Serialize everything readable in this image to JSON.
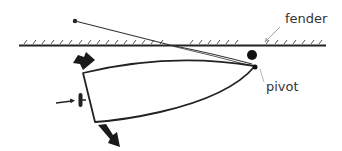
{
  "diagram": {
    "labels": {
      "fender": "fender",
      "pivot": "pivot"
    },
    "colors": {
      "stroke": "#222222",
      "fill": "#1a1a1a",
      "label": "#333333",
      "background": "#ffffff"
    },
    "elements": [
      {
        "name": "dock-wall",
        "type": "hatched-line"
      },
      {
        "name": "spring-line",
        "type": "rope",
        "from": "dock-cleat",
        "to": "bow-pivot"
      },
      {
        "name": "fender",
        "type": "circle"
      },
      {
        "name": "boat-hull",
        "type": "outline"
      },
      {
        "name": "propeller",
        "type": "icon"
      },
      {
        "name": "thrust-arrow",
        "type": "arrow",
        "direction": "right"
      },
      {
        "name": "stern-down-arrow",
        "type": "arrow",
        "direction": "down"
      },
      {
        "name": "stern-swing-arrow",
        "type": "arrow",
        "direction": "down-right"
      }
    ]
  }
}
